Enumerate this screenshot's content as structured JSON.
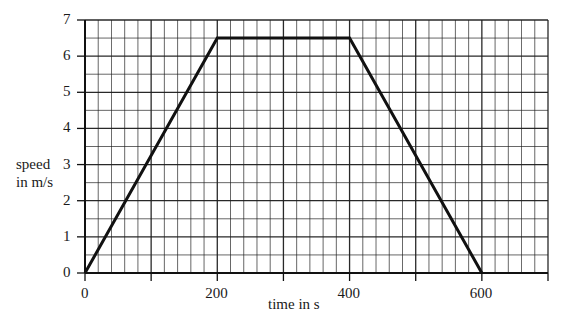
{
  "chart_data": {
    "type": "line",
    "title": "",
    "xlabel": "time in s",
    "ylabel": "speed in m/s",
    "ylabel_lines": [
      "speed",
      "in m/s"
    ],
    "xlim": [
      0,
      700
    ],
    "ylim": [
      0,
      7
    ],
    "x_ticks": [
      0,
      100,
      200,
      300,
      400,
      500,
      600,
      700
    ],
    "x_tick_labels": [
      "0",
      "",
      "200",
      "",
      "400",
      "",
      "600",
      ""
    ],
    "y_ticks": [
      0,
      1,
      2,
      3,
      4,
      5,
      6,
      7
    ],
    "y_tick_labels": [
      "0",
      "1",
      "2",
      "3",
      "4",
      "5",
      "6",
      "7"
    ],
    "grid": true,
    "grid_minor_x_step": 20,
    "grid_minor_y_step": 0.5,
    "legend": null,
    "series": [
      {
        "name": "speed-time",
        "x": [
          0,
          200,
          400,
          600
        ],
        "y": [
          0,
          6.5,
          6.5,
          0
        ]
      }
    ]
  },
  "colors": {
    "line": "#111111",
    "grid": "#1e1e1e",
    "axis": "#111111",
    "background": "#ffffff"
  }
}
